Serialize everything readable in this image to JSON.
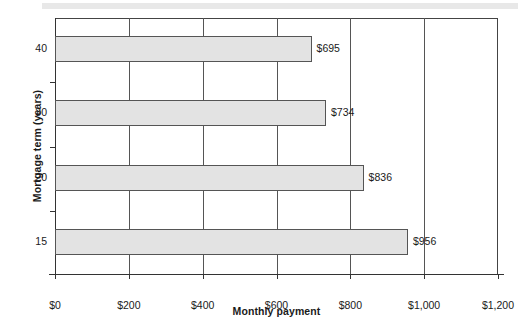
{
  "chart_data": {
    "type": "bar",
    "orientation": "horizontal",
    "title": "",
    "xlabel": "Monthly payment",
    "ylabel": "Mortgage term (years)",
    "categories": [
      "40",
      "30",
      "20",
      "15"
    ],
    "values": [
      695,
      734,
      836,
      956
    ],
    "data_labels": [
      "$695",
      "$734",
      "$836",
      "$956"
    ],
    "xlim": [
      0,
      1200
    ],
    "xticks": [
      0,
      200,
      400,
      600,
      800,
      1000,
      1200
    ],
    "xtick_labels": [
      "$0",
      "$200",
      "$400",
      "$600",
      "$800",
      "$1,000",
      "$1,200"
    ],
    "grid": "vertical",
    "legend": "none",
    "bar_fill_color": "#e3e3e3",
    "bar_border_color": "#555555",
    "axis_color": "#333333",
    "text_color": "#1a1a1a",
    "banner_color": "#e8e8e8"
  }
}
